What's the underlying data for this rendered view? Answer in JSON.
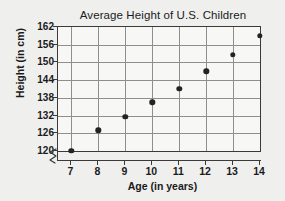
{
  "chart_data": {
    "type": "scatter",
    "title": "Average Height of U.S. Children",
    "xlabel": "Age (in years)",
    "ylabel": "Height (in cm)",
    "x": [
      7,
      8,
      9,
      10,
      11,
      12,
      13,
      14
    ],
    "values": [
      120,
      127,
      131.5,
      136.5,
      141,
      147,
      152.5,
      159
    ],
    "series": [
      {
        "name": "Average height",
        "values": [
          120,
          127,
          131.5,
          136.5,
          141,
          147,
          152.5,
          159
        ]
      }
    ],
    "xticks": [
      "7",
      "8",
      "9",
      "10",
      "11",
      "12",
      "13",
      "14"
    ],
    "yticks": [
      "120",
      "126",
      "132",
      "138",
      "144",
      "150",
      "156",
      "162"
    ],
    "xlim": [
      6.5,
      14
    ],
    "ylim": [
      120,
      162
    ],
    "grid": true,
    "legend": false,
    "legend_position": "none",
    "axis_break_x": true,
    "axis_break_y": true,
    "colors": {
      "point": "#232323",
      "gridline": "#8e8e8e",
      "axis": "#3a3a3a",
      "plot_background": "#f7f7f5",
      "figure_background": "#efefed",
      "text": "#1b1b1b"
    }
  }
}
